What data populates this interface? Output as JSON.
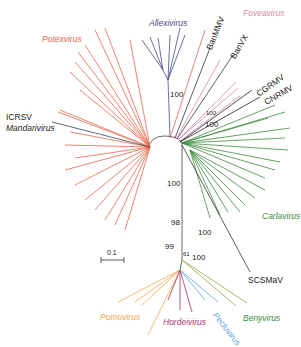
{
  "colors": {
    "potexvirus": "#e8664a",
    "allexivirus": "#4a4a8c",
    "foveavirus": "#d88aa8",
    "carlavirus": "#3d8a3d",
    "mandarivirus": "#333333",
    "pomovirus": "#f0a850",
    "hordeivirus": "#a03060",
    "pecluvirus": "#5aa0d8",
    "benyvirus": "#5a8a3a",
    "unassigned": "#222222"
  },
  "genera": [
    {
      "id": "potexvirus",
      "label": "Potexvirus"
    },
    {
      "id": "allexivirus",
      "label": "Allexivirus"
    },
    {
      "id": "foveavirus",
      "label": "Foveavirus"
    },
    {
      "id": "carlavirus",
      "label": "Carlavirus"
    },
    {
      "id": "mandarivirus",
      "label": "Mandarivirus"
    },
    {
      "id": "pomovirus",
      "label": "Pomovirus"
    },
    {
      "id": "hordeivirus",
      "label": "Hordeivirus"
    },
    {
      "id": "pecluvirus",
      "label": "Pecluvirus"
    },
    {
      "id": "benyvirus",
      "label": "Benyvirus"
    }
  ],
  "taxa": {
    "banmmv": "BanMMV",
    "banvx": "BanVX",
    "cgrmv": "CGRMV",
    "cnrmv": "CNRMV",
    "icrsv": "ICRSV",
    "scsmav": "SCSMaV"
  },
  "bootstrap": {
    "allexi": "100",
    "cgrmv_cnrmv_inner": "100",
    "cgrmv_cnrmv_outer": "100",
    "main_trunk": "100",
    "node_98": "98",
    "benyvirus": "100",
    "pomovirus": "99",
    "hordeivirus": "61",
    "pecluvirus": "100"
  },
  "scale_bar": {
    "label": "0.1"
  }
}
